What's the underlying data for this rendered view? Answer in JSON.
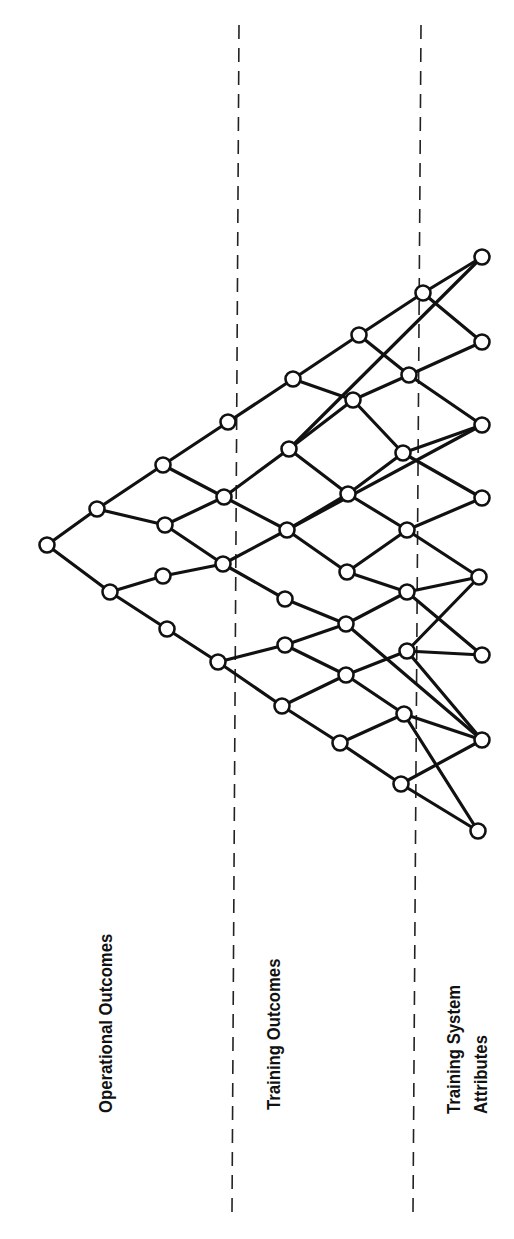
{
  "diagram": {
    "title": "",
    "orientation": "rotated-90-ccw",
    "colors": {
      "ink": "#111111",
      "background": "#ffffff"
    },
    "regions": [
      {
        "id": "operational",
        "label": "Operational Outcomes"
      },
      {
        "id": "training",
        "label": "Training Outcomes"
      },
      {
        "id": "attributes",
        "label_line1": "Training System",
        "label_line2": "Attributes"
      }
    ],
    "dividers": [
      {
        "id": "div1",
        "x1": 239,
        "y1": 25,
        "x2": 232,
        "y2": 1212
      },
      {
        "id": "div2",
        "x1": 421,
        "y1": 25,
        "x2": 413,
        "y2": 1212
      }
    ],
    "nodes": [
      {
        "id": "A",
        "x": 47,
        "y": 545
      },
      {
        "id": "B1",
        "x": 97,
        "y": 509
      },
      {
        "id": "B2",
        "x": 110,
        "y": 592
      },
      {
        "id": "C1",
        "x": 163,
        "y": 465
      },
      {
        "id": "C2",
        "x": 165,
        "y": 525
      },
      {
        "id": "C3",
        "x": 163,
        "y": 576
      },
      {
        "id": "C4",
        "x": 167,
        "y": 629
      },
      {
        "id": "D1",
        "x": 228,
        "y": 422
      },
      {
        "id": "D2",
        "x": 224,
        "y": 497
      },
      {
        "id": "D3",
        "x": 223,
        "y": 564
      },
      {
        "id": "D4",
        "x": 218,
        "y": 662
      },
      {
        "id": "E1",
        "x": 293,
        "y": 379
      },
      {
        "id": "E2",
        "x": 289,
        "y": 449
      },
      {
        "id": "E3",
        "x": 287,
        "y": 530
      },
      {
        "id": "E4",
        "x": 285,
        "y": 599
      },
      {
        "id": "E5",
        "x": 285,
        "y": 645
      },
      {
        "id": "E6",
        "x": 282,
        "y": 706
      },
      {
        "id": "F1",
        "x": 359,
        "y": 335
      },
      {
        "id": "F2",
        "x": 353,
        "y": 400
      },
      {
        "id": "F3",
        "x": 348,
        "y": 494
      },
      {
        "id": "F4",
        "x": 347,
        "y": 572
      },
      {
        "id": "F5",
        "x": 346,
        "y": 624
      },
      {
        "id": "F6",
        "x": 346,
        "y": 675
      },
      {
        "id": "F7",
        "x": 340,
        "y": 743
      },
      {
        "id": "G1",
        "x": 423,
        "y": 293
      },
      {
        "id": "G2",
        "x": 409,
        "y": 375
      },
      {
        "id": "G3",
        "x": 403,
        "y": 453
      },
      {
        "id": "G4",
        "x": 407,
        "y": 530
      },
      {
        "id": "G5",
        "x": 407,
        "y": 592
      },
      {
        "id": "G6",
        "x": 407,
        "y": 651
      },
      {
        "id": "G7",
        "x": 404,
        "y": 714
      },
      {
        "id": "G8",
        "x": 401,
        "y": 784
      },
      {
        "id": "H1",
        "x": 482,
        "y": 257
      },
      {
        "id": "H2",
        "x": 482,
        "y": 342
      },
      {
        "id": "H3",
        "x": 482,
        "y": 425
      },
      {
        "id": "H4",
        "x": 482,
        "y": 498
      },
      {
        "id": "H5",
        "x": 479,
        "y": 577
      },
      {
        "id": "H6",
        "x": 482,
        "y": 655
      },
      {
        "id": "H7",
        "x": 482,
        "y": 740
      },
      {
        "id": "H8",
        "x": 478,
        "y": 831
      }
    ],
    "edges": [
      [
        "A",
        "B1"
      ],
      [
        "A",
        "B2"
      ],
      [
        "B1",
        "C1"
      ],
      [
        "B1",
        "C2"
      ],
      [
        "B2",
        "C3"
      ],
      [
        "B2",
        "C4"
      ],
      [
        "C1",
        "D1"
      ],
      [
        "C1",
        "D2"
      ],
      [
        "C2",
        "D2"
      ],
      [
        "C2",
        "D3"
      ],
      [
        "C3",
        "D3"
      ],
      [
        "C4",
        "D4"
      ],
      [
        "D1",
        "E1"
      ],
      [
        "D2",
        "E2"
      ],
      [
        "D2",
        "E3"
      ],
      [
        "D3",
        "E3"
      ],
      [
        "D3",
        "E4"
      ],
      [
        "D4",
        "E5"
      ],
      [
        "D4",
        "E6"
      ],
      [
        "E1",
        "F1"
      ],
      [
        "E1",
        "F2"
      ],
      [
        "E2",
        "F2"
      ],
      [
        "E2",
        "F3"
      ],
      [
        "E2",
        "H1"
      ],
      [
        "E3",
        "F3"
      ],
      [
        "E3",
        "F4"
      ],
      [
        "E4",
        "F5"
      ],
      [
        "E5",
        "F5"
      ],
      [
        "E5",
        "F6"
      ],
      [
        "E6",
        "F6"
      ],
      [
        "E6",
        "F7"
      ],
      [
        "F1",
        "G1"
      ],
      [
        "F1",
        "G2"
      ],
      [
        "F2",
        "G2"
      ],
      [
        "F2",
        "G3"
      ],
      [
        "F3",
        "G3"
      ],
      [
        "F3",
        "G4"
      ],
      [
        "F4",
        "G4"
      ],
      [
        "F4",
        "G5"
      ],
      [
        "F5",
        "G5"
      ],
      [
        "F5",
        "H7"
      ],
      [
        "F6",
        "G6"
      ],
      [
        "F6",
        "G7"
      ],
      [
        "F7",
        "G7"
      ],
      [
        "F7",
        "G8"
      ],
      [
        "G1",
        "H1"
      ],
      [
        "G1",
        "H2"
      ],
      [
        "G2",
        "H2"
      ],
      [
        "G2",
        "H3"
      ],
      [
        "G3",
        "H3"
      ],
      [
        "G3",
        "H4"
      ],
      [
        "G4",
        "H4"
      ],
      [
        "G4",
        "H5"
      ],
      [
        "G5",
        "H5"
      ],
      [
        "G5",
        "H6"
      ],
      [
        "G6",
        "H5"
      ],
      [
        "G6",
        "H6"
      ],
      [
        "G6",
        "H7"
      ],
      [
        "G7",
        "H7"
      ],
      [
        "G7",
        "H8"
      ],
      [
        "G8",
        "H7"
      ],
      [
        "G8",
        "H8"
      ],
      [
        "E3",
        "H3"
      ]
    ]
  }
}
